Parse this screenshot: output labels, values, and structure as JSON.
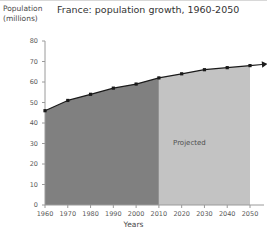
{
  "chart_data": {
    "type": "area",
    "title": "France: population growth, 1960-2050",
    "xlabel": "Years",
    "ylabel": "Population (millions)",
    "ylabel_line1": "Population",
    "ylabel_line2": "(millions)",
    "x": [
      1960,
      1970,
      1980,
      1990,
      2000,
      2010,
      2020,
      2030,
      2040,
      2050
    ],
    "values": [
      46,
      51,
      54,
      57,
      59,
      62,
      64,
      66,
      67,
      68
    ],
    "xlim": [
      1960,
      2050
    ],
    "ylim": [
      0,
      80
    ],
    "yticks": [
      0,
      10,
      20,
      30,
      40,
      50,
      60,
      70,
      80
    ],
    "ytick_labels": [
      "0",
      "10",
      "20",
      "30",
      "40",
      "50",
      "60",
      "70",
      "80"
    ],
    "xticks": [
      1960,
      1970,
      1980,
      1990,
      2000,
      2010,
      2020,
      2030,
      2040,
      2050
    ],
    "xtick_labels": [
      "1960",
      "1970",
      "1980",
      "1990",
      "2000",
      "2010",
      "2020",
      "2030",
      "2040",
      "2050"
    ],
    "grid": false,
    "legend": false,
    "annotations": [
      {
        "text": "Projected",
        "x": 2025,
        "y": 30
      }
    ],
    "regions": [
      {
        "name": "historical",
        "from": 1960,
        "to": 2010,
        "color": "#808080"
      },
      {
        "name": "projected",
        "from": 2010,
        "to": 2050,
        "color": "#c3c3c3"
      }
    ],
    "series_style": {
      "line_color": "#1a1a1a",
      "marker": "square",
      "marker_color": "#1a1a1a",
      "arrow_end": true
    }
  },
  "annotation": {
    "projected_label": "Projected"
  }
}
